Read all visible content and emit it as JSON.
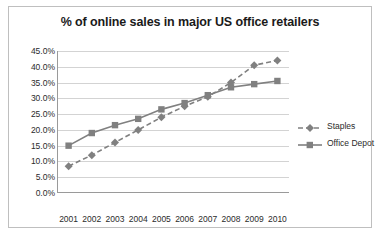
{
  "chart_data": {
    "type": "line",
    "title": "% of online sales in major US office retailers",
    "xlabel": "",
    "ylabel": "",
    "categories": [
      "2001",
      "2002",
      "2003",
      "2004",
      "2005",
      "2006",
      "2007",
      "2008",
      "2009",
      "2010"
    ],
    "series": [
      {
        "name": "Staples",
        "color": "#808080",
        "marker": "diamond",
        "line_style": "dashed",
        "values": [
          8.5,
          12.0,
          16.0,
          20.0,
          24.0,
          27.5,
          30.5,
          35.0,
          40.5,
          42.0
        ]
      },
      {
        "name": "Office Depot",
        "color": "#808080",
        "marker": "square",
        "line_style": "solid",
        "values": [
          15.0,
          19.0,
          21.5,
          23.5,
          26.5,
          28.5,
          31.0,
          33.5,
          34.5,
          35.5
        ]
      }
    ],
    "ylim": [
      0,
      45
    ],
    "ytick_step": 5,
    "ytick_labels": [
      "0.0%",
      "5.0%",
      "10.0%",
      "15.0%",
      "20.0%",
      "25.0%",
      "30.0%",
      "35.0%",
      "40.0%",
      "45.0%"
    ],
    "grid": true,
    "legend_position": "right",
    "value_suffix": "%"
  }
}
